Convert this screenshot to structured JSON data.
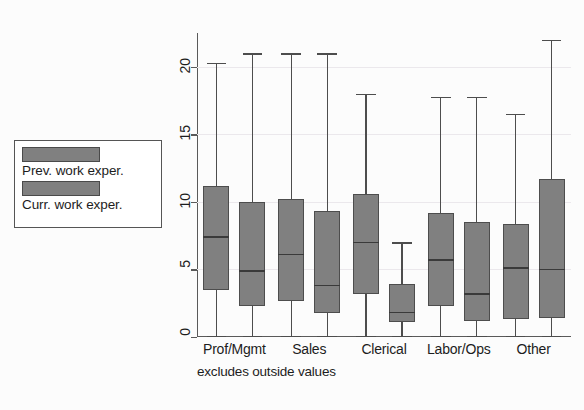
{
  "chart_data": {
    "type": "bar",
    "chart_subtype": "grouped-boxplot",
    "title": "",
    "xlabel": "",
    "ylabel": "",
    "ylim": [
      0,
      22.5
    ],
    "yticks": [
      0,
      5,
      10,
      15,
      20
    ],
    "ytick_labels": [
      "0",
      "5",
      "10",
      "15",
      "20"
    ],
    "grid": true,
    "legend_position": "outside-left",
    "footnote": "excludes outside values",
    "categories": [
      "Prof/Mgmt",
      "Sales",
      "Clerical",
      "Labor/Ops",
      "Other"
    ],
    "legend": [
      "Prev. work exper.",
      "Curr. work exper."
    ],
    "series": [
      {
        "name": "Prev. work exper.",
        "color": "#808080",
        "boxes": [
          {
            "category": "Prof/Mgmt",
            "lower_whisker": 0.0,
            "q1": 3.5,
            "median": 7.4,
            "q3": 11.2,
            "upper_whisker": 20.3
          },
          {
            "category": "Sales",
            "lower_whisker": 0.0,
            "q1": 2.7,
            "median": 6.1,
            "q3": 10.2,
            "upper_whisker": 21.0
          },
          {
            "category": "Clerical",
            "lower_whisker": 0.0,
            "q1": 3.2,
            "median": 7.0,
            "q3": 10.6,
            "upper_whisker": 18.0
          },
          {
            "category": "Labor/Ops",
            "lower_whisker": 0.0,
            "q1": 2.3,
            "median": 5.7,
            "q3": 9.2,
            "upper_whisker": 17.8
          },
          {
            "category": "Other",
            "lower_whisker": 0.0,
            "q1": 1.3,
            "median": 5.1,
            "q3": 8.4,
            "upper_whisker": 16.5
          }
        ]
      },
      {
        "name": "Curr. work exper.",
        "color": "#808080",
        "boxes": [
          {
            "category": "Prof/Mgmt",
            "lower_whisker": 0.0,
            "q1": 2.3,
            "median": 4.9,
            "q3": 10.0,
            "upper_whisker": 21.0
          },
          {
            "category": "Sales",
            "lower_whisker": 0.0,
            "q1": 1.8,
            "median": 3.8,
            "q3": 9.3,
            "upper_whisker": 21.0
          },
          {
            "category": "Clerical",
            "lower_whisker": 0.0,
            "q1": 1.1,
            "median": 1.8,
            "q3": 3.9,
            "upper_whisker": 7.0
          },
          {
            "category": "Labor/Ops",
            "lower_whisker": 0.0,
            "q1": 1.2,
            "median": 3.2,
            "q3": 8.5,
            "upper_whisker": 17.8
          },
          {
            "category": "Other",
            "lower_whisker": 0.0,
            "q1": 1.4,
            "median": 5.0,
            "q3": 11.7,
            "upper_whisker": 22.0
          }
        ]
      }
    ]
  },
  "legend": {
    "items": [
      {
        "label": "Prev. work exper.",
        "color": "#808080"
      },
      {
        "label": "Curr. work exper.",
        "color": "#808080"
      }
    ]
  },
  "axis": {
    "y_tick_labels": [
      "0",
      "5",
      "10",
      "15",
      "20"
    ],
    "x_tick_labels": [
      "Prof/Mgmt",
      "Sales",
      "Clerical",
      "Labor/Ops",
      "Other"
    ],
    "footnote": "excludes outside values"
  },
  "colors": {
    "box_fill": "#808080",
    "box_border": "#4d4d4d",
    "axis": "#5a5a5a",
    "grid": "#ebe8ec",
    "background": "#fcfcfc",
    "text": "#1d1d1d"
  }
}
